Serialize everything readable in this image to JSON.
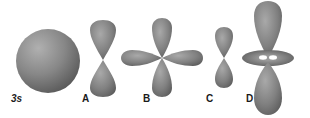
{
  "figure": {
    "orbitals": [
      {
        "id": "3s",
        "label": "3s",
        "shape": "sphere"
      },
      {
        "id": "A",
        "label": "A",
        "shape": "p-dumbbell"
      },
      {
        "id": "B",
        "label": "B",
        "shape": "d-cloverleaf"
      },
      {
        "id": "C",
        "label": "C",
        "shape": "p-dumbbell-small"
      },
      {
        "id": "D",
        "label": "D",
        "shape": "dz2-lobes-with-torus"
      }
    ],
    "colors": {
      "lobe_fill": "#7f7f7f",
      "lobe_highlight": "#b5b5b5",
      "lobe_shadow": "#555555",
      "background": "#ffffff",
      "label": "#1a1a1a"
    }
  }
}
